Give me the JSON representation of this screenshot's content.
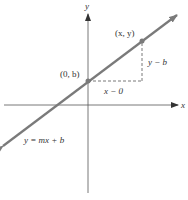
{
  "diagram": {
    "axes": {
      "x_label": "x",
      "y_label": "y"
    },
    "points": [
      {
        "id": "intercept",
        "label": "(0, b)"
      },
      {
        "id": "general",
        "label": "(x, y)"
      }
    ],
    "segments": {
      "run_label": "x − 0",
      "rise_label": "y − b"
    },
    "line": {
      "equation": "y = mx + b"
    },
    "colors": {
      "line": "#7a7a7a",
      "axes": "#555555",
      "dashed": "#555555",
      "point": "#7a7a7a",
      "text": "#333333"
    }
  }
}
